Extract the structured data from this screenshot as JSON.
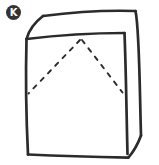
{
  "figure": {
    "badge": {
      "label": "K"
    },
    "drawing": {
      "name": "hand-drawn-box-with-hidden-fold-lines"
    },
    "colors": {
      "ink": "#2b2b2b",
      "badge-fill": "#333333",
      "badge-text": "#ffffff",
      "background": "#ffffff"
    }
  }
}
